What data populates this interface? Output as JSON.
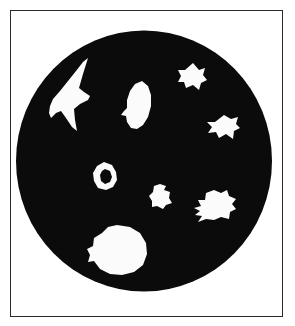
{
  "figure": {
    "caption": "",
    "background_color": "#ffffff",
    "frame": {
      "name": "figure-border",
      "stroke_color": "#2b2b2b",
      "stroke_width": 1.5,
      "x": 10,
      "y": 10,
      "width": 273,
      "height": 307
    },
    "field": {
      "name": "circular-field-of-view",
      "fill_color": "#0b0b0b",
      "center_x": 144,
      "center_y": 161,
      "radius_x": 128,
      "radius_y": 130.5
    },
    "particles": [
      {
        "id": "particle-1",
        "label": "large-arrowhead-particle",
        "fill_color": "#fbfbfb",
        "center_x": 73,
        "center_y": 99,
        "approx_width": 45,
        "approx_height": 82,
        "path": "M 88 58 L 83 74 L 79 88 L 84 92 L 90 96 L 88 100 L 80 104 L 74 109 L 75 120 L 77 131 L 72 127 L 66 118 L 61 111 L 56 113 L 51 118 L 49 113 L 50 106 L 53 99 L 60 91 L 68 81 L 76 71 L 83 62 Z"
      },
      {
        "id": "particle-2",
        "label": "elliptical-leaf-particle",
        "fill_color": "#fbfbfb",
        "center_x": 138,
        "center_y": 105,
        "approx_width": 27,
        "approx_height": 50,
        "path": "M 142 81 L 148 86 L 151 95 L 151 106 L 148 117 L 143 125 L 137 129 L 131 128 L 127 122 L 126 116 L 121 115 L 124 111 L 127 108 L 127 100 L 130 91 L 135 84 Z"
      },
      {
        "id": "particle-3",
        "label": "finned-triangular-particle",
        "fill_color": "#fbfbfb",
        "center_x": 192,
        "center_y": 78,
        "approx_width": 31,
        "approx_height": 30,
        "path": "M 193 63 L 199 70 L 205 68 L 203 75 L 207 80 L 201 83 L 199 90 L 193 85 L 186 88 L 184 82 L 178 82 L 181 76 L 178 70 L 185 70 Z"
      },
      {
        "id": "particle-4",
        "label": "butterfly-particle",
        "fill_color": "#fbfbfb",
        "center_x": 223,
        "center_y": 128,
        "approx_width": 33,
        "approx_height": 24,
        "path": "M 224 115 L 231 119 L 238 117 L 236 124 L 240 128 L 234 131 L 233 139 L 226 134 L 219 138 L 216 132 L 208 133 L 212 127 L 207 122 L 215 122 Z"
      },
      {
        "id": "particle-5",
        "label": "annular-ring-particle",
        "fill_color": "#fbfbfb",
        "center_x": 105,
        "center_y": 176,
        "approx_width": 24,
        "approx_height": 28,
        "outer_path": "M 104 162 L 112 165 L 116 172 L 117 180 L 113 187 L 106 190 L 98 188 L 94 181 L 93 173 L 97 166 Z",
        "inner_hole_path": "M 105 169 L 110 171 L 112 177 L 110 182 L 105 184 L 101 181 L 100 175 L 102 171 Z"
      },
      {
        "id": "particle-6",
        "label": "small-irregular-particle",
        "fill_color": "#fbfbfb",
        "center_x": 161,
        "center_y": 196,
        "approx_width": 21,
        "approx_height": 24,
        "path": "M 160 184 L 166 186 L 164 190 L 170 192 L 169 198 L 172 203 L 166 205 L 163 209 L 157 206 L 152 207 L 152 201 L 149 196 L 153 192 L 154 186 Z"
      },
      {
        "id": "particle-7",
        "label": "jagged-spiky-particle",
        "fill_color": "#fbfbfb",
        "center_x": 216,
        "center_y": 205,
        "approx_width": 38,
        "approx_height": 33,
        "path": "M 214 190 L 221 193 L 227 190 L 229 196 L 236 199 L 232 204 L 236 209 L 230 212 L 229 219 L 221 217 L 214 220 L 206 219 L 198 222 L 202 216 L 195 215 L 200 211 L 194 208 L 201 206 L 198 200 L 205 200 L 206 193 Z"
      },
      {
        "id": "particle-8",
        "label": "large-round-colony-particle",
        "fill_color": "#fbfbfb",
        "center_x": 117,
        "center_y": 250,
        "approx_width": 58,
        "approx_height": 50,
        "path": "M 117 225 L 130 227 L 140 233 L 146 243 L 147 254 L 143 265 L 134 272 L 122 275 L 110 274 L 100 269 L 94 261 L 88 262 L 90 255 L 87 249 L 93 246 L 94 238 L 102 233 L 108 227 Z"
      }
    ]
  }
}
